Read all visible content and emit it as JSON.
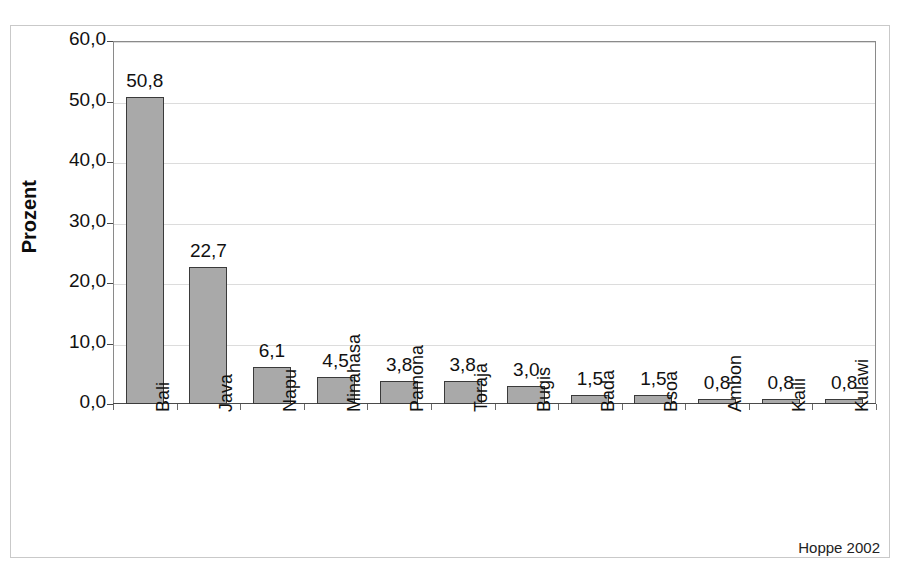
{
  "chart_data": {
    "type": "bar",
    "title": "",
    "xlabel": "",
    "ylabel": "Prozent",
    "ylim": [
      0,
      60
    ],
    "ytick_labels": [
      "0,0",
      "10,0",
      "20,0",
      "30,0",
      "40,0",
      "50,0",
      "60,0"
    ],
    "ytick_values": [
      0,
      10,
      20,
      30,
      40,
      50,
      60
    ],
    "grid": true,
    "legend": "none",
    "categories": [
      "Bali",
      "Java",
      "Napu",
      "Minahasa",
      "Pamona",
      "Toraja",
      "Bugis",
      "Bada",
      "Bsoa",
      "Ambon",
      "Kaili",
      "Kulawi"
    ],
    "values": [
      50.8,
      22.7,
      6.1,
      4.5,
      3.8,
      3.8,
      3.0,
      1.5,
      1.5,
      0.8,
      0.8,
      0.8
    ],
    "value_labels": [
      "50,8",
      "22,7",
      "6,1",
      "4,5",
      "3,8",
      "3,8",
      "3,0",
      "1,5",
      "1,5",
      "0,8",
      "0,8",
      "0,8"
    ],
    "bar_color": "#a9a9a9",
    "bar_border_color": "#3a3a3a",
    "annotations": [
      "Hoppe 2002"
    ]
  },
  "axis": {
    "y_title": "Prozent"
  },
  "footer": {
    "source": "Hoppe 2002"
  },
  "header": {
    "cropped_title": ""
  }
}
